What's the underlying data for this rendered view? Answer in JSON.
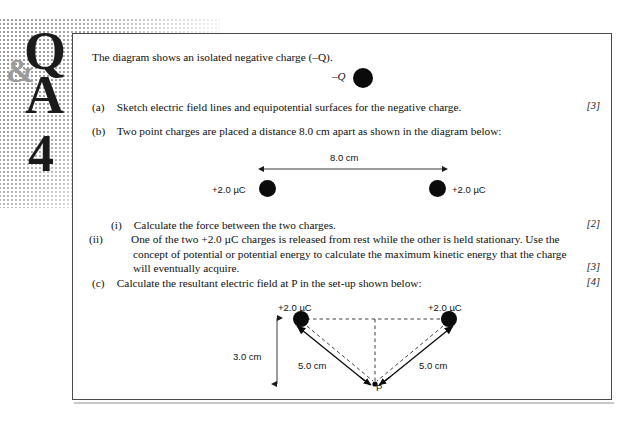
{
  "logo": {
    "q": "Q",
    "amp": "&",
    "a": "A",
    "number": "4"
  },
  "question": {
    "intro": "The diagram shows an isolated negative charge (–Q).",
    "parts": [
      {
        "label": "(a)",
        "text": "Sketch electric field lines and equipotential surfaces for the negative charge.",
        "marks": "[3]"
      },
      {
        "label": "(b)",
        "text": "Two point charges are placed a distance 8.0 cm apart as shown in the diagram below:",
        "marks": ""
      },
      {
        "label": "(i)",
        "text": "Calculate the force between the two charges.",
        "marks": "[2]"
      },
      {
        "label": "(ii)",
        "text": "One of the two +2.0 µC charges is released from rest while the other is held stationary. Use the concept of potential or potential energy to calculate the maximum kinetic energy that the charge will eventually acquire.",
        "marks": "[3]"
      },
      {
        "label": "(c)",
        "text": "Calculate the resultant electric field at P in the set-up shown below:",
        "marks": "[4]"
      }
    ]
  },
  "diagram_a": {
    "charge_label": "–Q"
  },
  "diagram_b": {
    "distance_label": "8.0 cm",
    "left_charge_label": "+2.0 µC",
    "right_charge_label": "+2.0 µC"
  },
  "diagram_c": {
    "left_charge_label": "+2.0 µC",
    "right_charge_label": "+2.0 µC",
    "height_label": "3.0 cm",
    "left_distance_label": "5.0 cm",
    "right_distance_label": "5.0 cm",
    "point_label": "P"
  },
  "colors": {
    "ink": "#101010",
    "border": "#4a4a4a",
    "halftone": "#8a8a8a",
    "logo_amp": "#9b9b9b"
  }
}
